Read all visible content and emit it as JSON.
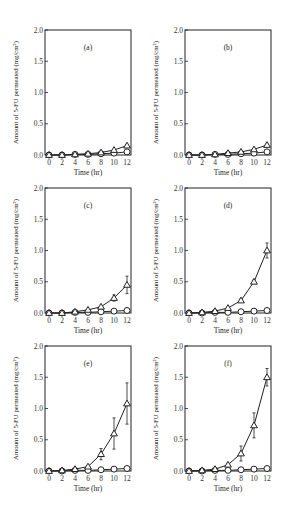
{
  "figure": {
    "panels": [
      "(a)",
      "(b)",
      "(c)",
      "(d)",
      "(e)",
      "(f)"
    ]
  },
  "chart_data": [
    {
      "type": "line",
      "panel": "(a)",
      "title": "(a)",
      "xlabel": "Time (hr)",
      "ylabel": "Amount of 5-FU permeated (mg/cm²)",
      "xlim": [
        0,
        12
      ],
      "ylim": [
        0,
        2.0
      ],
      "x": [
        0,
        2,
        4,
        6,
        8,
        10,
        12
      ],
      "xticks": [
        "0",
        "2",
        "4",
        "6",
        "8",
        "10",
        "12"
      ],
      "yticks": [
        "0.0",
        "0.5",
        "1.0",
        "1.5",
        "2.0"
      ],
      "series": [
        {
          "name": "triangle",
          "marker": "triangle",
          "values": [
            0.0,
            0.0,
            0.01,
            0.02,
            0.04,
            0.08,
            0.15
          ],
          "errors": [
            0,
            0,
            0,
            0,
            0,
            0.01,
            0.02
          ]
        },
        {
          "name": "circle",
          "marker": "circle",
          "values": [
            0.0,
            0.0,
            0.01,
            0.01,
            0.02,
            0.03,
            0.05
          ],
          "errors": [
            0,
            0,
            0,
            0,
            0,
            0,
            0
          ]
        }
      ]
    },
    {
      "type": "line",
      "panel": "(b)",
      "title": "(b)",
      "xlabel": "Time (hr)",
      "ylabel": "Amount of 5-FU permeated (mg/cm²)",
      "xlim": [
        0,
        12
      ],
      "ylim": [
        0,
        2.0
      ],
      "x": [
        0,
        2,
        4,
        6,
        8,
        10,
        12
      ],
      "xticks": [
        "0",
        "2",
        "4",
        "6",
        "8",
        "10",
        "12"
      ],
      "yticks": [
        "0.0",
        "0.5",
        "1.0",
        "1.5",
        "2.0"
      ],
      "series": [
        {
          "name": "triangle",
          "marker": "triangle",
          "values": [
            0.0,
            0.0,
            0.01,
            0.03,
            0.05,
            0.09,
            0.16
          ],
          "errors": [
            0,
            0,
            0,
            0,
            0,
            0.01,
            0.02
          ]
        },
        {
          "name": "circle",
          "marker": "circle",
          "values": [
            0.0,
            0.0,
            0.01,
            0.01,
            0.02,
            0.03,
            0.05
          ],
          "errors": [
            0,
            0,
            0,
            0,
            0,
            0,
            0
          ]
        }
      ]
    },
    {
      "type": "line",
      "panel": "(c)",
      "title": "(c)",
      "xlabel": "Time (hr)",
      "ylabel": "Amount of 5-FU permeated (mg/cm²)",
      "xlim": [
        0,
        12
      ],
      "ylim": [
        0,
        2.0
      ],
      "x": [
        0,
        2,
        4,
        6,
        8,
        10,
        12
      ],
      "xticks": [
        "0",
        "2",
        "4",
        "6",
        "8",
        "10",
        "12"
      ],
      "yticks": [
        "0.0",
        "0.5",
        "1.0",
        "1.5",
        "2.0"
      ],
      "series": [
        {
          "name": "triangle",
          "marker": "triangle",
          "values": [
            0.0,
            0.0,
            0.02,
            0.05,
            0.1,
            0.24,
            0.45
          ],
          "errors": [
            0,
            0,
            0,
            0.01,
            0.02,
            0.05,
            0.14
          ]
        },
        {
          "name": "circle",
          "marker": "circle",
          "values": [
            0.0,
            0.0,
            0.01,
            0.01,
            0.02,
            0.03,
            0.04
          ],
          "errors": [
            0,
            0,
            0,
            0,
            0,
            0,
            0
          ]
        }
      ]
    },
    {
      "type": "line",
      "panel": "(d)",
      "title": "(d)",
      "xlabel": "Time (hr)",
      "ylabel": "Amount of 5-FU permeated (mg/cm²)",
      "xlim": [
        0,
        12
      ],
      "ylim": [
        0,
        2.0
      ],
      "x": [
        0,
        2,
        4,
        6,
        8,
        10,
        12
      ],
      "xticks": [
        "0",
        "2",
        "4",
        "6",
        "8",
        "10",
        "12"
      ],
      "yticks": [
        "0.0",
        "0.5",
        "1.0",
        "1.5",
        "2.0"
      ],
      "series": [
        {
          "name": "triangle",
          "marker": "triangle",
          "values": [
            0.0,
            0.01,
            0.03,
            0.08,
            0.2,
            0.5,
            1.0
          ],
          "errors": [
            0,
            0,
            0,
            0.01,
            0.02,
            0.03,
            0.12
          ]
        },
        {
          "name": "circle",
          "marker": "circle",
          "values": [
            0.0,
            0.0,
            0.01,
            0.01,
            0.02,
            0.03,
            0.04
          ],
          "errors": [
            0,
            0,
            0,
            0,
            0,
            0,
            0
          ]
        }
      ]
    },
    {
      "type": "line",
      "panel": "(e)",
      "title": "(e)",
      "xlabel": "Time (hr)",
      "ylabel": "Amount of 5-FU permeated (mg/cm²)",
      "xlim": [
        0,
        12
      ],
      "ylim": [
        0,
        2.0
      ],
      "x": [
        0,
        2,
        4,
        6,
        8,
        10,
        12
      ],
      "xticks": [
        "0",
        "2",
        "4",
        "6",
        "8",
        "10",
        "12"
      ],
      "yticks": [
        "0.0",
        "0.5",
        "1.0",
        "1.5",
        "2.0"
      ],
      "series": [
        {
          "name": "triangle",
          "marker": "triangle",
          "values": [
            0.0,
            0.01,
            0.03,
            0.07,
            0.27,
            0.6,
            1.08
          ],
          "errors": [
            0,
            0,
            0,
            0.01,
            0.09,
            0.25,
            0.33
          ]
        },
        {
          "name": "circle",
          "marker": "circle",
          "values": [
            0.0,
            0.0,
            0.01,
            0.01,
            0.02,
            0.03,
            0.04
          ],
          "errors": [
            0,
            0,
            0,
            0,
            0,
            0,
            0
          ]
        }
      ]
    },
    {
      "type": "line",
      "panel": "(f)",
      "title": "(f)",
      "xlabel": "Time (hr)",
      "ylabel": "Amount of 5-FU permeated (mg/cm²)",
      "xlim": [
        0,
        12
      ],
      "ylim": [
        0,
        2.0
      ],
      "x": [
        0,
        2,
        4,
        6,
        8,
        10,
        12
      ],
      "xticks": [
        "0",
        "2",
        "4",
        "6",
        "8",
        "10",
        "12"
      ],
      "yticks": [
        "0.0",
        "0.5",
        "1.0",
        "1.5",
        "2.0"
      ],
      "series": [
        {
          "name": "triangle",
          "marker": "triangle",
          "values": [
            0.0,
            0.01,
            0.03,
            0.1,
            0.28,
            0.73,
            1.5
          ],
          "errors": [
            0,
            0,
            0,
            0.02,
            0.12,
            0.2,
            0.14
          ]
        },
        {
          "name": "circle",
          "marker": "circle",
          "values": [
            0.0,
            0.0,
            0.01,
            0.01,
            0.02,
            0.03,
            0.04
          ],
          "errors": [
            0,
            0,
            0,
            0,
            0,
            0,
            0
          ]
        }
      ]
    }
  ]
}
